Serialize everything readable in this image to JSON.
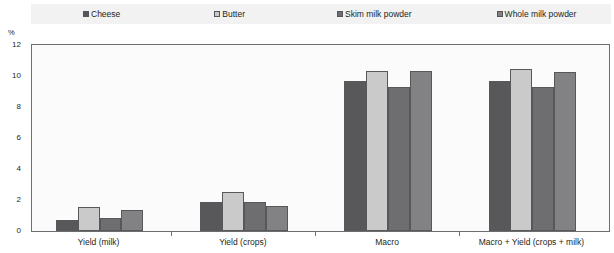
{
  "chart_data": {
    "type": "bar",
    "title": "",
    "subtitle": "",
    "xlabel": "",
    "ylabel": "%",
    "ylim": [
      0,
      12
    ],
    "yticks": [
      0,
      2,
      4,
      6,
      8,
      10,
      12
    ],
    "grid": false,
    "legend_position": "top",
    "categories": [
      "Yield (milk)",
      "Yield (crops)",
      "Macro",
      "Macro + Yield (crops + milk)"
    ],
    "series": [
      {
        "name": "Cheese",
        "color": "#58585a",
        "values": [
          0.7,
          1.9,
          9.7,
          9.65
        ]
      },
      {
        "name": "Butter",
        "color": "#cacaca",
        "values": [
          1.55,
          2.5,
          10.3,
          10.45
        ]
      },
      {
        "name": "Skim milk powder",
        "color": "#6e6e70",
        "values": [
          0.85,
          1.85,
          9.3,
          9.3
        ]
      },
      {
        "name": "Whole milk powder",
        "color": "#828284",
        "values": [
          1.35,
          1.6,
          10.35,
          10.25
        ]
      }
    ]
  },
  "legend": {
    "items": [
      {
        "label": "Cheese",
        "icon": "legend-swatch-icon"
      },
      {
        "label": "Butter",
        "icon": "legend-swatch-icon"
      },
      {
        "label": "Skim milk powder",
        "icon": "legend-swatch-icon"
      },
      {
        "label": "Whole milk powder",
        "icon": "legend-swatch-icon"
      }
    ]
  },
  "axes": {
    "y_unit": "%",
    "y_tick_labels": [
      "0",
      "2",
      "4",
      "6",
      "8",
      "10",
      "12"
    ],
    "x_tick_labels": [
      "Yield (milk)",
      "Yield (crops)",
      "Macro",
      "Macro + Yield (crops + milk)"
    ]
  },
  "colors": {
    "plot_background": "#fbfbfb",
    "legend_background": "#f2f2f2",
    "axis": "#6d6e71",
    "text": "#231f20"
  }
}
